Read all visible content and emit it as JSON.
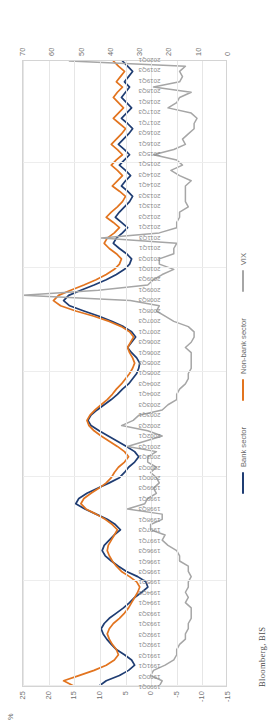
{
  "chart_data": {
    "type": "line",
    "title": "",
    "subtitle": "",
    "xlabel": "",
    "ylabel": "%",
    "ylim": [
      -15,
      25
    ],
    "yticks": [
      25,
      20,
      15,
      10,
      5,
      0,
      -5,
      -10,
      -15
    ],
    "y2label": "",
    "y2lim": [
      0,
      70
    ],
    "y2ticks": [
      70,
      60,
      50,
      40,
      30,
      20,
      10,
      0
    ],
    "grid": true,
    "legend_position": "bottom",
    "source": "Bloomberg, BIS",
    "x": [
      "1990Q1",
      "1990Q2",
      "1990Q3",
      "1990Q4",
      "1991Q1",
      "1991Q2",
      "1991Q3",
      "1991Q4",
      "1992Q1",
      "1992Q2",
      "1992Q3",
      "1992Q4",
      "1993Q1",
      "1993Q2",
      "1993Q3",
      "1993Q4",
      "1994Q1",
      "1994Q2",
      "1994Q3",
      "1994Q4",
      "1995Q1",
      "1995Q2",
      "1995Q3",
      "1995Q4",
      "1996Q1",
      "1996Q2",
      "1996Q3",
      "1996Q4",
      "1997Q1",
      "1997Q2",
      "1997Q3",
      "1997Q4",
      "1998Q1",
      "1998Q2",
      "1998Q3",
      "1998Q4",
      "1999Q1",
      "1999Q2",
      "1999Q3",
      "1999Q4",
      "2000Q1",
      "2000Q2",
      "2000Q3",
      "2000Q4",
      "2001Q1",
      "2001Q2",
      "2001Q3",
      "2001Q4",
      "2002Q1",
      "2002Q2",
      "2002Q3",
      "2002Q4",
      "2003Q1",
      "2003Q2",
      "2003Q3",
      "2003Q4",
      "2004Q1",
      "2004Q2",
      "2004Q3",
      "2004Q4",
      "2005Q1",
      "2005Q2",
      "2005Q3",
      "2005Q4",
      "2006Q1",
      "2006Q2",
      "2006Q3",
      "2006Q4",
      "2007Q1",
      "2007Q2",
      "2007Q3",
      "2007Q4",
      "2008Q1",
      "2008Q2",
      "2008Q3",
      "2008Q4",
      "2009Q1",
      "2009Q2",
      "2009Q3",
      "2009Q4",
      "2010Q1",
      "2010Q2",
      "2010Q3",
      "2010Q4",
      "2011Q1",
      "2011Q2",
      "2011Q3",
      "2011Q4",
      "2012Q1",
      "2012Q2",
      "2012Q3",
      "2012Q4",
      "2013Q1",
      "2013Q2",
      "2013Q3",
      "2013Q4",
      "2014Q1",
      "2014Q2",
      "2014Q3",
      "2014Q4",
      "2015Q1",
      "2015Q2",
      "2015Q3",
      "2015Q4",
      "2016Q1",
      "2016Q2",
      "2016Q3",
      "2016Q4",
      "2017Q1",
      "2017Q2",
      "2017Q3",
      "2017Q4",
      "2018Q1",
      "2018Q2",
      "2018Q3",
      "2018Q4",
      "2019Q1",
      "2019Q2",
      "2019Q3",
      "2019Q4",
      "2020Q1"
    ],
    "xtick_labels": [
      "1990Q1",
      "1990Q3",
      "1991Q1",
      "1991Q3",
      "1992Q1",
      "1992Q3",
      "1993Q1",
      "1993Q3",
      "1994Q1",
      "1994Q3",
      "1995Q1",
      "1995Q3",
      "1996Q1",
      "1996Q3",
      "1997Q1",
      "1997Q3",
      "1998Q1",
      "1998Q3",
      "1999Q1",
      "1999Q3",
      "2000Q1",
      "2000Q3",
      "2001Q1",
      "2001Q3",
      "2002Q1",
      "2002Q3",
      "2003Q1",
      "2003Q3",
      "2004Q1",
      "2004Q3",
      "2005Q1",
      "2005Q3",
      "2006Q1",
      "2006Q3",
      "2007Q1",
      "2007Q3",
      "2008Q1",
      "2008Q3",
      "2009Q1",
      "2009Q3",
      "2010Q1",
      "2010Q3",
      "2011Q1",
      "2011Q3",
      "2012Q1",
      "2012Q3",
      "2013Q1",
      "2013Q3",
      "2014Q1",
      "2014Q3",
      "2015Q1",
      "2015Q3",
      "2016Q1",
      "2016Q3",
      "2017Q1",
      "2017Q3",
      "2018Q1",
      "2018Q3",
      "2019Q1",
      "2019Q3",
      "2020Q1"
    ],
    "series": [
      {
        "name": "Bank sector",
        "color": "#1F3D73",
        "axis": "primary",
        "values": [
          10.0,
          8.6,
          6.0,
          4.2,
          3.0,
          3.6,
          5.0,
          6.6,
          7.6,
          8.5,
          9.2,
          9.6,
          9.0,
          8.0,
          6.6,
          5.2,
          4.0,
          3.0,
          1.6,
          0.4,
          0.8,
          2.4,
          4.6,
          6.2,
          7.6,
          8.8,
          9.4,
          9.0,
          8.0,
          7.0,
          5.8,
          6.8,
          8.4,
          10.6,
          12.8,
          14.6,
          14.0,
          12.4,
          10.2,
          8.0,
          6.0,
          5.0,
          4.2,
          3.0,
          2.2,
          3.0,
          4.6,
          6.4,
          8.2,
          10.0,
          11.6,
          12.2,
          11.6,
          10.4,
          9.0,
          7.6,
          6.4,
          5.4,
          4.2,
          3.4,
          2.6,
          2.2,
          2.0,
          2.6,
          3.6,
          4.4,
          3.6,
          2.8,
          3.6,
          5.2,
          7.4,
          10.0,
          13.0,
          15.8,
          17.0,
          16.0,
          13.6,
          11.0,
          8.6,
          6.6,
          5.0,
          4.0,
          3.6,
          4.6,
          6.0,
          7.2,
          6.6,
          5.4,
          4.4,
          5.6,
          6.8,
          6.0,
          5.0,
          4.0,
          3.4,
          4.4,
          5.6,
          4.8,
          3.8,
          4.8,
          6.0,
          5.0,
          4.0,
          5.0,
          6.2,
          5.2,
          4.2,
          3.4,
          4.4,
          5.6,
          4.6,
          3.6,
          4.6,
          5.6,
          4.8,
          4.0,
          5.0,
          4.2,
          3.4,
          4.4,
          5.4
        ]
      },
      {
        "name": "Non-bank sector",
        "color": "#E2741F",
        "axis": "primary",
        "values": [
          15.0,
          17.0,
          14.0,
          11.0,
          8.6,
          7.0,
          6.2,
          6.6,
          7.4,
          8.0,
          8.4,
          8.0,
          7.2,
          6.0,
          5.0,
          4.2,
          3.6,
          3.0,
          2.4,
          2.0,
          2.6,
          4.0,
          5.6,
          6.6,
          7.4,
          8.0,
          8.4,
          8.2,
          7.6,
          7.0,
          6.4,
          7.4,
          8.8,
          10.6,
          12.6,
          13.6,
          13.0,
          11.6,
          10.0,
          8.6,
          7.6,
          7.0,
          6.2,
          5.0,
          4.2,
          5.0,
          6.4,
          8.0,
          9.6,
          11.0,
          12.0,
          12.4,
          11.8,
          10.8,
          9.6,
          8.4,
          7.4,
          6.6,
          5.6,
          4.8,
          4.0,
          3.4,
          3.0,
          3.4,
          4.0,
          4.4,
          3.8,
          3.2,
          4.0,
          5.6,
          8.0,
          11.0,
          14.6,
          17.6,
          19.0,
          18.0,
          15.6,
          13.0,
          10.6,
          8.6,
          7.0,
          6.0,
          5.6,
          6.6,
          8.0,
          9.0,
          8.4,
          7.0,
          6.0,
          7.2,
          8.6,
          7.6,
          6.4,
          5.4,
          4.8,
          6.0,
          7.4,
          6.4,
          5.4,
          6.4,
          7.6,
          6.6,
          5.4,
          6.4,
          7.6,
          6.6,
          5.6,
          4.8,
          6.0,
          7.2,
          6.2,
          5.2,
          6.2,
          7.2,
          6.4,
          5.4,
          6.6,
          5.8,
          5.0,
          6.2,
          7.2
        ]
      },
      {
        "name": "VIX",
        "color": "#A6A6A6",
        "axis": "secondary",
        "values": [
          23,
          22,
          26,
          25,
          21,
          18,
          17,
          17,
          16,
          14,
          14,
          13,
          13,
          12,
          12,
          12,
          14,
          13,
          14,
          13,
          13,
          12,
          13,
          13,
          16,
          16,
          17,
          20,
          22,
          21,
          26,
          26,
          22,
          22,
          34,
          28,
          27,
          24,
          25,
          23,
          24,
          26,
          24,
          27,
          27,
          24,
          34,
          28,
          22,
          27,
          36,
          32,
          30,
          22,
          20,
          17,
          17,
          16,
          14,
          13,
          13,
          12,
          12,
          12,
          12,
          14,
          12,
          11,
          11,
          13,
          18,
          21,
          24,
          23,
          33,
          70,
          44,
          27,
          25,
          22,
          18,
          23,
          23,
          18,
          18,
          17,
          43,
          23,
          17,
          17,
          16,
          16,
          13,
          14,
          14,
          14,
          14,
          12,
          16,
          19,
          15,
          17,
          25,
          18,
          14,
          15,
          13,
          11,
          11,
          10,
          12,
          20,
          17,
          16,
          12,
          25,
          16,
          15,
          16,
          14,
          54
        ]
      }
    ]
  },
  "axes": {
    "primary_tick_labels": [
      "25",
      "20",
      "15",
      "10",
      "5",
      "0",
      "-5",
      "-10",
      "-15"
    ],
    "secondary_tick_labels": [
      "70",
      "60",
      "50",
      "40",
      "30",
      "20",
      "10",
      "0"
    ],
    "percent_symbol": "%"
  },
  "legend": {
    "items": [
      {
        "label": "Bank sector",
        "color": "#1F3D73"
      },
      {
        "label": "Non-bank sector",
        "color": "#E2741F"
      },
      {
        "label": "VIX",
        "color": "#A6A6A6"
      }
    ]
  },
  "footer": {
    "source": "Bloomberg,  BIS"
  }
}
